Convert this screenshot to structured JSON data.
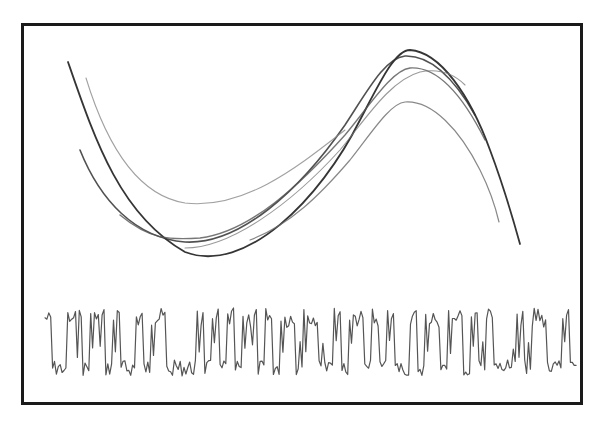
{
  "figure": {
    "frame": {
      "x": 21,
      "y": 23,
      "width": 562,
      "height": 382,
      "stroke": "#1a1a1a",
      "stroke_width": 3
    },
    "attractor": {
      "label": "phase-portrait",
      "trajectories": [
        {
          "name": "outer-dark",
          "color": "#2a2a2a",
          "width": 1.8,
          "opacity": 0.95,
          "d": "M68,62 C95,140 120,215 185,252 C245,275 320,200 360,120 C380,82 395,50 410,50 C440,52 470,95 490,150 C505,190 512,215 520,244"
        },
        {
          "name": "second-dark",
          "color": "#333333",
          "width": 1.6,
          "opacity": 0.85,
          "d": "M80,150 C100,200 135,238 185,242 C240,245 300,190 345,125 C368,90 385,58 405,56 C432,55 455,80 475,115"
        },
        {
          "name": "inner-band",
          "color": "#555555",
          "width": 1.4,
          "opacity": 0.8,
          "d": "M120,215 C150,240 170,240 200,238 C250,232 300,185 345,135 C370,105 392,70 410,68 C440,66 465,100 485,140"
        },
        {
          "name": "inner-band-2",
          "color": "#777777",
          "width": 1.1,
          "opacity": 0.75,
          "d": "M185,248 C230,248 290,205 340,150 C365,120 390,80 420,72 C440,68 455,75 465,85"
        },
        {
          "name": "upper-light",
          "color": "#8a8a8a",
          "width": 1.1,
          "opacity": 0.8,
          "d": "M86,78 C105,140 135,195 185,203 C245,210 300,165 345,130"
        },
        {
          "name": "lower-inner",
          "color": "#6a6a6a",
          "width": 1.2,
          "opacity": 0.8,
          "d": "M250,240 C290,225 320,195 350,160 C370,135 390,103 405,102 C432,100 460,130 480,170 C490,190 495,205 499,222"
        }
      ]
    },
    "time_series": {
      "label": "signal-trace",
      "color": "#555555",
      "width": 1.2,
      "x_start": 45,
      "x_end": 578,
      "y_high": 318,
      "y_low": 368,
      "pattern": [
        1,
        0,
        0,
        1,
        1,
        0,
        1,
        1,
        0,
        1,
        0,
        0,
        1,
        0,
        1,
        1,
        0,
        0,
        0,
        0,
        1,
        0,
        1,
        0,
        1,
        0,
        1,
        1,
        0,
        1,
        0,
        1,
        1,
        0,
        1,
        1,
        0,
        0,
        1,
        0,
        1,
        1,
        0,
        1,
        0,
        1,
        0,
        0,
        1,
        0,
        1,
        1,
        0,
        1,
        1,
        0,
        1,
        0,
        1,
        0,
        0,
        0,
        1,
        0,
        1,
        1,
        0,
        0,
        1,
        0
      ]
    }
  }
}
